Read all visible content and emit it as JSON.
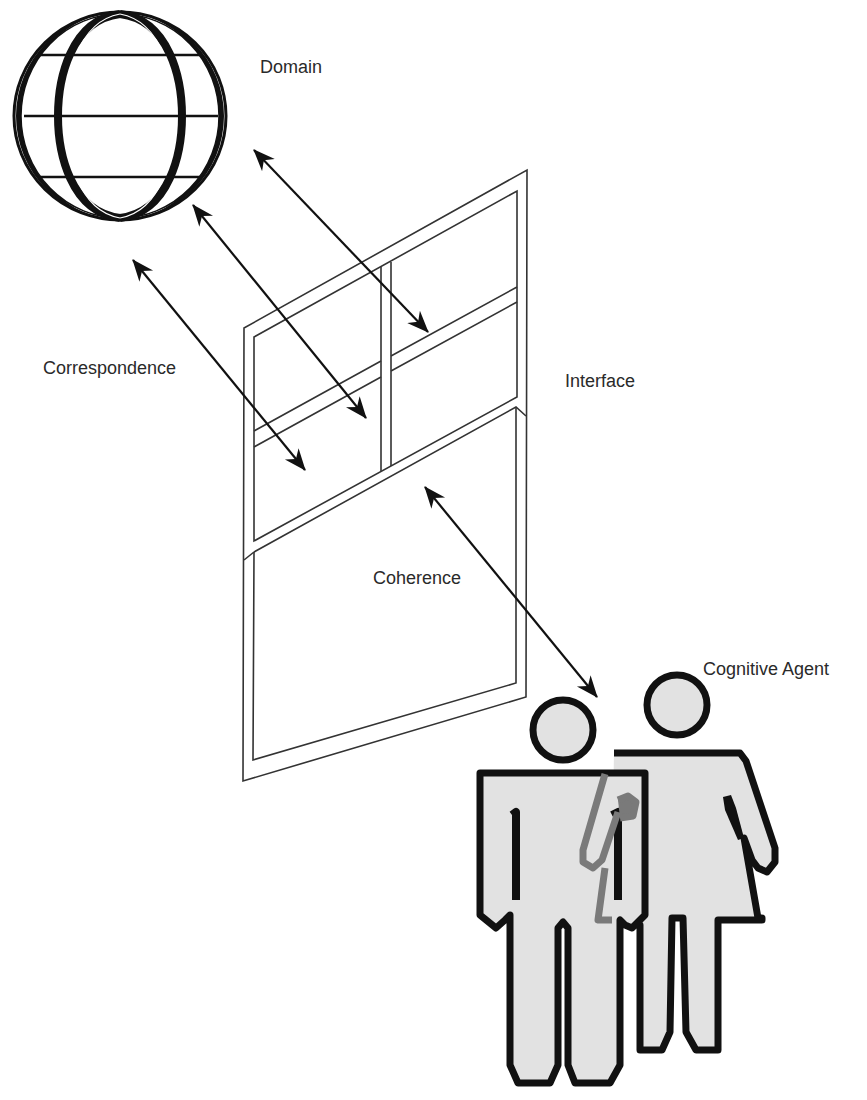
{
  "diagram": {
    "labels": {
      "domain": "Domain",
      "correspondence": "Correspondence",
      "interface": "Interface",
      "coherence": "Coherence",
      "cognitive_agent": "Cognitive Agent"
    },
    "nodes": [
      {
        "id": "domain",
        "shape": "globe-icon"
      },
      {
        "id": "interface",
        "shape": "window-icon"
      },
      {
        "id": "cognitive_agent",
        "shape": "people-icon"
      }
    ],
    "edges": [
      {
        "from": "domain",
        "to": "interface",
        "label": "Correspondence",
        "bidirectional": true,
        "count": 3
      },
      {
        "from": "interface",
        "to": "cognitive_agent",
        "label": "Coherence",
        "bidirectional": true,
        "count": 1
      }
    ],
    "colors": {
      "stroke": "#111111",
      "figure_fill": "#e2e2e2",
      "arm_gray": "#7a7a7a",
      "text": "#2a2a2a"
    }
  }
}
